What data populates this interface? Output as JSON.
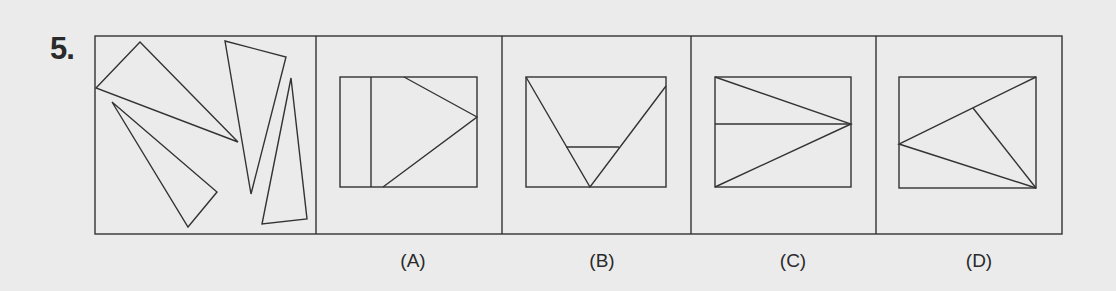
{
  "question": {
    "number": "5.",
    "problem_figure": {
      "description": "Four scattered triangles inside a square frame",
      "shapes": [
        {
          "type": "triangle",
          "points": [
            [
              96,
              88
            ],
            [
              140,
              42
            ],
            [
              238,
              142
            ]
          ]
        },
        {
          "type": "triangle",
          "points": [
            [
              112,
              102
            ],
            [
              217,
              192
            ],
            [
              188,
              227
            ]
          ]
        },
        {
          "type": "triangle",
          "points": [
            [
              225,
              41
            ],
            [
              286,
              57
            ],
            [
              251,
              194
            ]
          ]
        },
        {
          "type": "triangle",
          "points": [
            [
              291,
              78
            ],
            [
              307,
              219
            ],
            [
              262,
              224
            ]
          ]
        }
      ]
    },
    "options": [
      {
        "label": "(A)",
        "center_x": 413
      },
      {
        "label": "(B)",
        "center_x": 602
      },
      {
        "label": "(C)",
        "center_x": 793
      },
      {
        "label": "(D)",
        "center_x": 979
      }
    ]
  },
  "colors": {
    "background": "#ebebeb",
    "line": "#333333",
    "text": "#2a2a2a"
  }
}
